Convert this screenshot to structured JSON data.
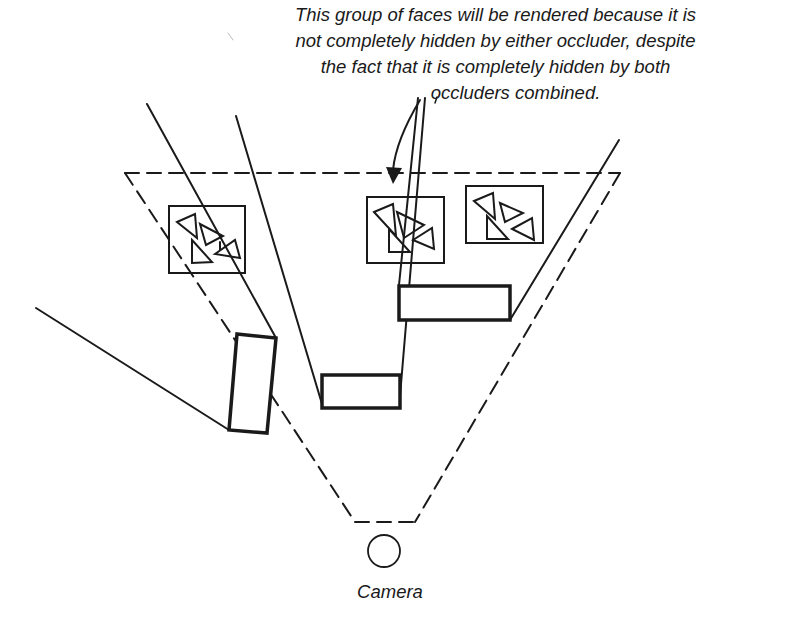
{
  "caption": {
    "lines": [
      "This group of faces will be rendered because it is",
      "not completely hidden by either occluder, despite",
      "the fact that it is completely hidden by both",
      "occluders combined."
    ]
  },
  "camera": {
    "label": "Camera"
  },
  "elements": {
    "frustum": "dashed view frustum",
    "occluders": [
      "left occluder",
      "center occluder",
      "right occluder"
    ],
    "face_groups": [
      "left face group",
      "middle face group",
      "right face group"
    ]
  },
  "colors": {
    "ink": "#1a1a1a",
    "background": "#ffffff"
  }
}
